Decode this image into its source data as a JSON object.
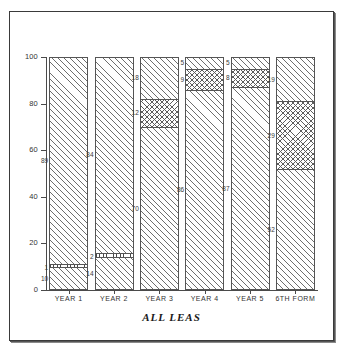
{
  "chart_data": {
    "type": "bar",
    "variant": "stacked-100-percent",
    "title": "ALL LEAS",
    "xlabel": "",
    "ylabel": "",
    "ylim": [
      0,
      100
    ],
    "yticks": [
      0,
      20,
      40,
      60,
      80,
      100
    ],
    "grid": false,
    "legend": "none",
    "categories": [
      "YEAR 1",
      "YEAR 2",
      "YEAR 3",
      "YEAR 4",
      "YEAR 5",
      "6TH FORM"
    ],
    "series": [
      {
        "name": "bottom-diagonal-hatch",
        "pattern": "diagonal-hatch",
        "values": [
          10,
          14,
          70,
          86,
          87,
          52
        ]
      },
      {
        "name": "middle-crosshatch",
        "pattern": "crosshatch",
        "values": [
          1,
          2,
          12,
          9,
          8,
          29
        ]
      },
      {
        "name": "top-diagonal-hatch",
        "pattern": "diagonal-hatch",
        "values": [
          89,
          84,
          18,
          5,
          5,
          19
        ]
      }
    ],
    "bars": [
      {
        "category": "YEAR 1",
        "segments": [
          {
            "label": "10",
            "value": 10,
            "pattern": "diagonal-hatch"
          },
          {
            "label": "1",
            "value": 1,
            "pattern": "dotted-band"
          },
          {
            "label": "89",
            "value": 89,
            "pattern": "diagonal-hatch"
          }
        ]
      },
      {
        "category": "YEAR 2",
        "segments": [
          {
            "label": "14",
            "value": 14,
            "pattern": "diagonal-hatch"
          },
          {
            "label": "2",
            "value": 2,
            "pattern": "dotted-band"
          },
          {
            "label": "84",
            "value": 84,
            "pattern": "diagonal-hatch"
          }
        ]
      },
      {
        "category": "YEAR 3",
        "segments": [
          {
            "label": "70",
            "value": 70,
            "pattern": "diagonal-hatch"
          },
          {
            "label": "12",
            "value": 12,
            "pattern": "crosshatch"
          },
          {
            "label": "18",
            "value": 18,
            "pattern": "diagonal-hatch"
          }
        ]
      },
      {
        "category": "YEAR 4",
        "segments": [
          {
            "label": "86",
            "value": 86,
            "pattern": "diagonal-hatch"
          },
          {
            "label": "9",
            "value": 9,
            "pattern": "crosshatch"
          },
          {
            "label": "5",
            "value": 5,
            "pattern": "diagonal-hatch"
          }
        ]
      },
      {
        "category": "YEAR 5",
        "segments": [
          {
            "label": "87",
            "value": 87,
            "pattern": "diagonal-hatch"
          },
          {
            "label": "8",
            "value": 8,
            "pattern": "crosshatch"
          },
          {
            "label": "5",
            "value": 5,
            "pattern": "diagonal-hatch"
          }
        ]
      },
      {
        "category": "6TH FORM",
        "segments": [
          {
            "label": "52",
            "value": 52,
            "pattern": "diagonal-hatch"
          },
          {
            "label": "29",
            "value": 29,
            "pattern": "crosshatch"
          },
          {
            "label": "19",
            "value": 19,
            "pattern": "diagonal-hatch"
          }
        ]
      }
    ],
    "colors": {
      "background": "#ffffff",
      "axis": "#4a4a4a",
      "frame": "#3a3a3a",
      "hatch": "#6e6e6e",
      "text": "#333333"
    }
  }
}
